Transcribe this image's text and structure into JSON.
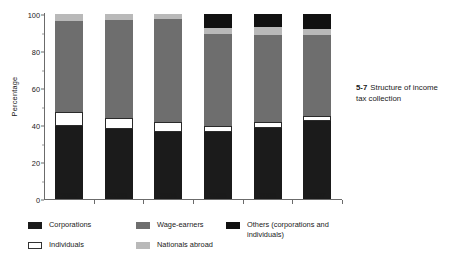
{
  "caption": {
    "number": "5-7",
    "text": "Structure of income tax collection"
  },
  "chart_data": {
    "type": "bar",
    "stacked": true,
    "normalized_to_percent": true,
    "title": "Structure of income tax collection",
    "xlabel": "",
    "ylabel": "Percentage",
    "ylim": [
      0,
      100
    ],
    "yticks": [
      0,
      20,
      40,
      60,
      80,
      100
    ],
    "ytick_labels": [
      "0",
      "20",
      "40",
      "60",
      "80",
      "100"
    ],
    "grid": false,
    "legend_position": "below",
    "categories": [
      "2002",
      "2003",
      "2004",
      "2005",
      "2006",
      "2007"
    ],
    "series": [
      {
        "name": "Corporations",
        "color": "#1b1b1b",
        "values": [
          39.5,
          38.0,
          36.0,
          36.0,
          38.5,
          42.0
        ]
      },
      {
        "name": "Individuals",
        "color": "#ffffff",
        "values": [
          7.5,
          6.0,
          5.5,
          3.5,
          3.0,
          3.0
        ]
      },
      {
        "name": "Wage-earners",
        "color": "#6e6e6e",
        "values": [
          49.5,
          53.0,
          56.0,
          49.5,
          47.0,
          43.5
        ]
      },
      {
        "name": "Nationals abroad",
        "color": "#b9b9b9",
        "values": [
          3.5,
          3.0,
          2.5,
          3.5,
          4.5,
          3.5
        ]
      },
      {
        "name": "Others (corporations and individuals)",
        "color": "#111111",
        "values": [
          0,
          0,
          0,
          7.5,
          7.0,
          8.0
        ]
      }
    ]
  },
  "legend": {
    "entries": [
      {
        "label": "Corporations",
        "swatch_class": "sw-corporations"
      },
      {
        "label": "Wage-earners",
        "swatch_class": "sw-wage"
      },
      {
        "label": "Others (corporations and individuals)",
        "swatch_class": "sw-others"
      },
      {
        "label": "Individuals",
        "swatch_class": "sw-individuals"
      },
      {
        "label": "Nationals abroad",
        "swatch_class": "sw-nationals"
      }
    ]
  }
}
